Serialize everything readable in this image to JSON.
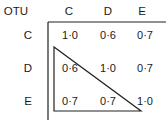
{
  "matrix": {
    "corner_label": "OTU",
    "column_headers": [
      "C",
      "D",
      "E"
    ],
    "rows": [
      {
        "label": "C",
        "values": [
          "1·0",
          "0·6",
          "0·7"
        ]
      },
      {
        "label": "D",
        "values": [
          "0·6",
          "1·0",
          "0·7"
        ]
      },
      {
        "label": "E",
        "values": [
          "0·7",
          "0·7",
          "1·0"
        ]
      }
    ],
    "highlight": "triangle enclosing lower-left half of matrix"
  }
}
